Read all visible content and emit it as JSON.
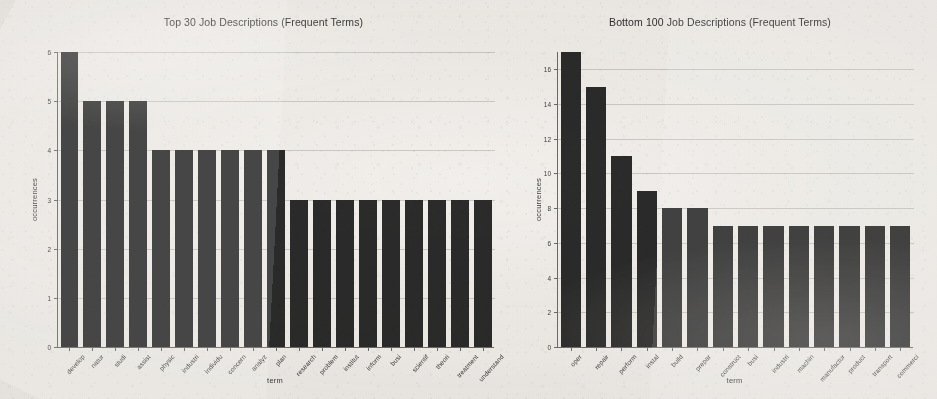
{
  "figure": {
    "background_color": "#f2f0ed",
    "bar_color": "#2b2b2b",
    "axis_color": "#6a6a6a"
  },
  "chart_data": [
    {
      "type": "bar",
      "title": "Top 30 Job Descriptions (Frequent Terms)",
      "xlabel": "term",
      "ylabel": "occurrences",
      "ylim": [
        0,
        6
      ],
      "yticks": [
        0,
        1,
        2,
        3,
        4,
        5,
        6
      ],
      "grid": true,
      "legend": null,
      "categories": [
        "develop",
        "natur",
        "studi",
        "assist",
        "physic",
        "industri",
        "individu",
        "concern",
        "analyz",
        "plan",
        "research",
        "problem",
        "institut",
        "inform",
        "busi",
        "scientif",
        "theori",
        "treatment",
        "understand"
      ],
      "values": [
        6,
        5,
        5,
        5,
        4,
        4,
        4,
        4,
        4,
        4,
        3,
        3,
        3,
        3,
        3,
        3,
        3,
        3,
        3
      ]
    },
    {
      "type": "bar",
      "title": "Bottom 100 Job Descriptions (Frequent Terms)",
      "xlabel": "term",
      "ylabel": "occurrences",
      "ylim": [
        0,
        17
      ],
      "yticks": [
        0,
        2,
        4,
        6,
        8,
        10,
        12,
        14,
        16
      ],
      "grid": true,
      "legend": null,
      "categories": [
        "oper",
        "repair",
        "perform",
        "instal",
        "build",
        "prepar",
        "construct",
        "busi",
        "industri",
        "machin",
        "manufactur",
        "product",
        "transport",
        "commerci"
      ],
      "values": [
        17,
        15,
        11,
        9,
        8,
        8,
        7,
        7,
        7,
        7,
        7,
        7,
        7,
        7
      ]
    }
  ]
}
